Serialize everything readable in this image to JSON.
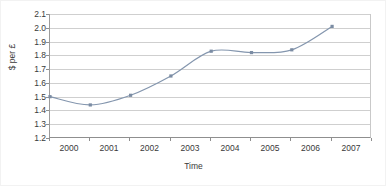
{
  "chart_data": {
    "type": "line",
    "title": "",
    "xlabel": "Time",
    "ylabel": "$ per £",
    "categories": [
      "2000",
      "2001",
      "2002",
      "2003",
      "2004",
      "2005",
      "2006",
      "2007"
    ],
    "x": [
      2000,
      2001,
      2002,
      2003,
      2004,
      2005,
      2006,
      2007
    ],
    "values": [
      1.5,
      1.44,
      1.51,
      1.65,
      1.83,
      1.82,
      1.84,
      2.01
    ],
    "series": [
      {
        "name": "$ per £",
        "values": [
          1.5,
          1.44,
          1.51,
          1.65,
          1.83,
          1.82,
          1.84,
          2.01
        ]
      }
    ],
    "ylim": [
      1.2,
      2.1
    ],
    "ytick_labels": [
      "2.1",
      "2.0",
      "1.9",
      "1.8",
      "1.7",
      "1.6",
      "1.5",
      "1.4",
      "1.3",
      "1.2"
    ],
    "ytick_values": [
      2.1,
      2.0,
      1.9,
      1.8,
      1.7,
      1.6,
      1.5,
      1.4,
      1.3,
      1.2
    ],
    "ytick_step": 0.1,
    "grid": true,
    "grid_axis": "y",
    "legend": false,
    "legend_position": "none",
    "smoothed": true,
    "marker": "square",
    "line_color": "#8496ae",
    "marker_color": "#7b8ca3",
    "grid_color": "#cfcfcf",
    "axis_color": "#8f8f8f",
    "text_color": "#3a3a3a",
    "background": "#ffffff"
  }
}
